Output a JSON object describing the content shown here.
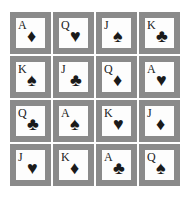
{
  "board": {
    "rows": 4,
    "cols": 4,
    "tile_color": "#8a8a8a",
    "card_color": "#fdfdfd",
    "cards": [
      {
        "rank": "A",
        "suit": "diamond",
        "glyph": "♦"
      },
      {
        "rank": "Q",
        "suit": "heart",
        "glyph": "♥"
      },
      {
        "rank": "J",
        "suit": "spade",
        "glyph": "♠"
      },
      {
        "rank": "K",
        "suit": "club",
        "glyph": "♣"
      },
      {
        "rank": "K",
        "suit": "spade",
        "glyph": "♠"
      },
      {
        "rank": "J",
        "suit": "club",
        "glyph": "♣"
      },
      {
        "rank": "Q",
        "suit": "diamond",
        "glyph": "♦"
      },
      {
        "rank": "A",
        "suit": "heart",
        "glyph": "♥"
      },
      {
        "rank": "Q",
        "suit": "club",
        "glyph": "♣"
      },
      {
        "rank": "A",
        "suit": "spade",
        "glyph": "♠"
      },
      {
        "rank": "K",
        "suit": "heart",
        "glyph": "♥"
      },
      {
        "rank": "J",
        "suit": "diamond",
        "glyph": "♦"
      },
      {
        "rank": "J",
        "suit": "heart",
        "glyph": "♥"
      },
      {
        "rank": "K",
        "suit": "diamond",
        "glyph": "♦"
      },
      {
        "rank": "A",
        "suit": "club",
        "glyph": "♣"
      },
      {
        "rank": "Q",
        "suit": "spade",
        "glyph": "♠"
      }
    ]
  }
}
